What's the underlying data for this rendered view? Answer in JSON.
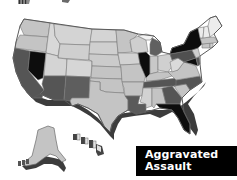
{
  "title": {
    "line1": "Aggravated",
    "line2": "Assault",
    "background": "#000000",
    "color": "#ffffff"
  },
  "legend_shades": {
    "highest": "#0d0d0d",
    "high": "#555555",
    "low": "#c4c4c4",
    "lowest": "#ececec"
  },
  "map": {
    "subject": "Aggravated Assault by state",
    "style": "grayscale choropleth, 3D extruded",
    "states": {
      "WA": "low",
      "OR": "low",
      "CA": "high",
      "NV": "highest",
      "ID": "low",
      "MT": "low",
      "WY": "low",
      "UT": "low",
      "CO": "low",
      "AZ": "high",
      "NM": "high",
      "ND": "low",
      "SD": "low",
      "NE": "low",
      "KS": "low",
      "OK": "low",
      "TX": "low",
      "MN": "low",
      "IA": "low",
      "MO": "low",
      "AR": "low",
      "LA": "high",
      "WI": "low",
      "IL": "highest",
      "MI": "high",
      "IN": "low",
      "OH": "low",
      "KY": "low",
      "TN": "high",
      "MS": "low",
      "AL": "low",
      "GA": "high",
      "FL": "highest",
      "SC": "low",
      "NC": "high",
      "VA": "low",
      "WV": "low",
      "PA": "high",
      "NY": "highest",
      "MD": "highest",
      "DE": "high",
      "NJ": "low",
      "VT": "lowest",
      "NH": "lowest",
      "ME": "lowest",
      "MA": "low",
      "CT": "low",
      "RI": "low",
      "AK": "low",
      "HI": "lowest"
    }
  }
}
